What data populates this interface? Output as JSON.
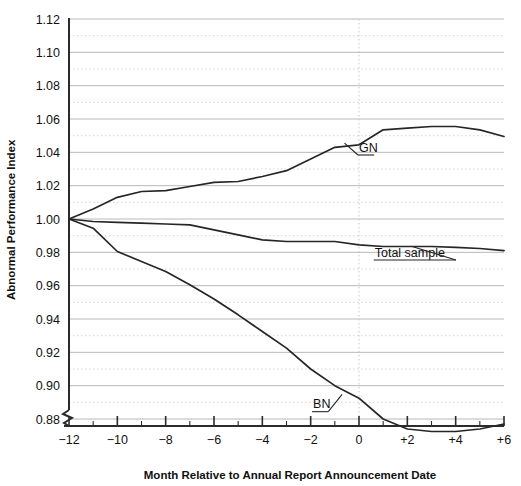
{
  "chart_data": {
    "type": "line",
    "title": "",
    "xlabel": "Month Relative to Annual Report Announcement Date",
    "ylabel": "Abnormal Performance Index",
    "xlim": [
      -12,
      6
    ],
    "ylim": [
      0.88,
      1.12
    ],
    "y_axis_break": true,
    "grid": {
      "horizontal_major_step": 0.02,
      "horizontal_minor_step": 0.01,
      "vertical_reference_x": 0,
      "major_style": "solid",
      "minor_style": "dotted"
    },
    "legend": "inline-annotations",
    "y_ticks": [
      "0.88",
      "0.90",
      "0.92",
      "0.94",
      "0.96",
      "0.98",
      "1.00",
      "1.02",
      "1.04",
      "1.06",
      "1.08",
      "1.10",
      "1.12"
    ],
    "x_ticks": [
      "−12",
      "−10",
      "−8",
      "−6",
      "−4",
      "−2",
      "0",
      "+2",
      "+4",
      "+6"
    ],
    "x_minor_ticks": [
      -11,
      -9,
      -7,
      -5,
      -3,
      -1,
      1,
      3,
      5
    ],
    "x": [
      -12,
      -11,
      -10,
      -9,
      -8,
      -7,
      -6,
      -5,
      -4,
      -3,
      -2,
      -1,
      0,
      1,
      2,
      3,
      4,
      5,
      6
    ],
    "series": [
      {
        "name": "GN",
        "label": "GN",
        "color": "#262626",
        "values": [
          1.0,
          1.006,
          1.013,
          1.0165,
          1.017,
          1.0195,
          1.022,
          1.0225,
          1.0255,
          1.029,
          1.036,
          1.043,
          1.0445,
          1.0535,
          1.0545,
          1.0555,
          1.0555,
          1.0535,
          1.0495
        ]
      },
      {
        "name": "Total sample",
        "label": "Total sample",
        "color": "#262626",
        "values": [
          1.0,
          0.9985,
          0.998,
          0.9975,
          0.997,
          0.9965,
          0.9935,
          0.9905,
          0.9875,
          0.9865,
          0.9865,
          0.9865,
          0.9845,
          0.9835,
          0.9835,
          0.9835,
          0.983,
          0.9823,
          0.981
        ]
      },
      {
        "name": "BN",
        "label": "BN",
        "color": "#262626",
        "values": [
          1.0,
          0.9945,
          0.9805,
          0.9745,
          0.9685,
          0.9605,
          0.952,
          0.9425,
          0.9325,
          0.9225,
          0.91,
          0.9,
          0.8925,
          0.88,
          0.874,
          0.8725,
          0.8725,
          0.874,
          0.877
        ]
      }
    ],
    "annotations": [
      {
        "name": "GN",
        "text": "GN",
        "x": 0.0,
        "y": 1.0405,
        "leader_to_x": -0.6,
        "leader_to_y": 1.0455,
        "underline": true
      },
      {
        "name": "Total sample",
        "text": "Total sample",
        "x": 0.65,
        "y": 0.9775,
        "leader_to_x": 2.2,
        "leader_to_y": 0.9835,
        "underline": true
      },
      {
        "name": "BN",
        "text": "BN",
        "x": -1.9,
        "y": 0.8865,
        "leader_to_x": -0.7,
        "leader_to_y": 0.8948,
        "underline": true
      }
    ]
  },
  "colors": {
    "axis": "#2b2b2b",
    "grid_major": "#b8b8b8",
    "grid_minor": "#cfcfcf",
    "curve": "#262626",
    "text": "#111111"
  }
}
